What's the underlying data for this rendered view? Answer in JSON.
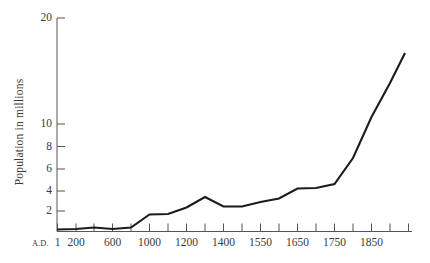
{
  "chart_data": {
    "type": "line",
    "title": "",
    "subtitle": "",
    "xlabel": "",
    "ylabel": "Population in millions",
    "x_axis_prefix": "A.D.",
    "grid": false,
    "legend": null,
    "x_tick_labels": [
      "1",
      "200",
      "600",
      "1000",
      "1200",
      "1400",
      "1550",
      "1650",
      "1750",
      "1850"
    ],
    "y_tick_labels": [
      "20",
      "10",
      "8",
      "6",
      "4",
      "2"
    ],
    "y_tick_values": [
      20,
      10,
      8,
      6,
      4,
      2
    ],
    "ylim": [
      0,
      20
    ],
    "y_scale": "log-like (compressed upper range)",
    "x_scale": "categorical / unevenly-spaced historical dates",
    "x": [
      1,
      200,
      400,
      600,
      800,
      1000,
      1100,
      1200,
      1300,
      1400,
      1500,
      1550,
      1600,
      1650,
      1700,
      1750,
      1800,
      1850
    ],
    "values": [
      1.0,
      1.0,
      1.1,
      1.0,
      1.1,
      1.7,
      1.7,
      2.2,
      3.2,
      2.3,
      2.3,
      3.0,
      3.8,
      5.3,
      5.2,
      6.0,
      9.5,
      16.0
    ],
    "series": [
      {
        "name": "Population in millions",
        "values": [
          1.0,
          1.0,
          1.1,
          1.0,
          1.1,
          1.7,
          1.7,
          2.2,
          3.2,
          2.3,
          2.3,
          3.0,
          3.8,
          5.3,
          5.2,
          6.0,
          9.5,
          16.0
        ]
      }
    ],
    "line_color": "#1c1c1c",
    "line_width": 2.1,
    "axis_color": "#555555"
  },
  "axes": {
    "y_ticks": [
      {
        "label": "20",
        "y": 18
      },
      {
        "label": "10",
        "y": 124
      },
      {
        "label": "8",
        "y": 146.5
      },
      {
        "label": "6",
        "y": 169
      },
      {
        "label": "4",
        "y": 191
      },
      {
        "label": "2",
        "y": 211
      }
    ],
    "x_ticks": [
      {
        "label": "1",
        "x": 57.5
      },
      {
        "label": "200",
        "x": 76
      },
      {
        "label": "",
        "x": 94
      },
      {
        "label": "600",
        "x": 112.5
      },
      {
        "label": "",
        "x": 131
      },
      {
        "label": "1000",
        "x": 149.5
      },
      {
        "label": "",
        "x": 168
      },
      {
        "label": "1200",
        "x": 186.5
      },
      {
        "label": "",
        "x": 205
      },
      {
        "label": "1400",
        "x": 223.5
      },
      {
        "label": "",
        "x": 242
      },
      {
        "label": "1550",
        "x": 260.5
      },
      {
        "label": "",
        "x": 279
      },
      {
        "label": "1650",
        "x": 297.5
      },
      {
        "label": "",
        "x": 316
      },
      {
        "label": "1750",
        "x": 334.5
      },
      {
        "label": "",
        "x": 353
      },
      {
        "label": "1850",
        "x": 371.5
      },
      {
        "label": "",
        "x": 390
      },
      {
        "label": "",
        "x": 408.5
      }
    ],
    "prefix_label": "A.D."
  },
  "line_path": "M 57,229.5 L 76,229 L 94,227.5 L 112.5,229 L 131,227.5 L 149.5,214.5 L 168,214 L 186.5,207.5 L 205,197 L 223.5,206.5 L 242,206.5 L 260.5,202 L 279,198.5 L 297.5,188.5 L 316,188 L 334.5,184 L 353,158 L 371.5,117 L 390,83 L 405,53",
  "axis_lines": {
    "y_axis": {
      "x": 57,
      "y_top": 18,
      "y_bottom": 231.5
    },
    "x_axis": {
      "y": 231.5,
      "x_left": 57,
      "x_right": 412
    }
  }
}
